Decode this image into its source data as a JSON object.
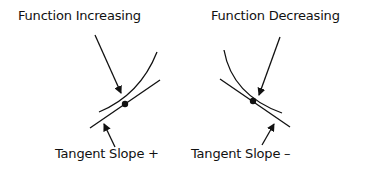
{
  "panels": [
    {
      "title": "Function Increasing",
      "tangent_label": "Tangent Slope +",
      "sign": "+"
    },
    {
      "title": "Function Decreasing",
      "tangent_label": "Tangent Slope –",
      "sign": "-"
    }
  ],
  "colors": {
    "ink": "#111111",
    "background": "#ffffff"
  }
}
